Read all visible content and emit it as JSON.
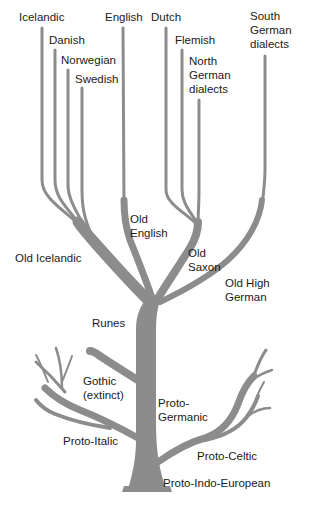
{
  "diagram": {
    "branch_color": "#8c8c8c",
    "text_color": "#1a1a1a",
    "background": "#ffffff",
    "root": "Proto-Indo-European",
    "nodes": {
      "icelandic": "Icelandic",
      "danish": "Danish",
      "norwegian": "Norwegian",
      "swedish": "Swedish",
      "english": "English",
      "dutch": "Dutch",
      "flemish": "Flemish",
      "north_german_1": "North",
      "north_german_2": "German",
      "north_german_3": "dialects",
      "south_german_1": "South",
      "south_german_2": "German",
      "south_german_3": "dialects",
      "old_english_1": "Old",
      "old_english_2": "English",
      "old_icelandic": "Old Icelandic",
      "old_saxon_1": "Old",
      "old_saxon_2": "Saxon",
      "old_high_german_1": "Old High",
      "old_high_german_2": "German",
      "runes": "Runes",
      "gothic_1": "Gothic",
      "gothic_2": "(extinct)",
      "proto_germanic_1": "Proto-",
      "proto_germanic_2": "Germanic",
      "proto_italic": "Proto-Italic",
      "proto_celtic": "Proto-Celtic",
      "proto_indo_european": "Proto-Indo-European"
    },
    "edges": [
      [
        "Proto-Indo-European",
        "Proto-Germanic"
      ],
      [
        "Proto-Indo-European",
        "Proto-Italic"
      ],
      [
        "Proto-Indo-European",
        "Proto-Celtic"
      ],
      [
        "Proto-Germanic",
        "Gothic (extinct)"
      ],
      [
        "Proto-Germanic",
        "Runes"
      ],
      [
        "Runes",
        "Old Icelandic"
      ],
      [
        "Runes",
        "Old English"
      ],
      [
        "Runes",
        "Old Saxon"
      ],
      [
        "Runes",
        "Old High German"
      ],
      [
        "Old Icelandic",
        "Icelandic"
      ],
      [
        "Old Icelandic",
        "Danish"
      ],
      [
        "Old Icelandic",
        "Norwegian"
      ],
      [
        "Old Icelandic",
        "Swedish"
      ],
      [
        "Old English",
        "English"
      ],
      [
        "Old Saxon",
        "Dutch"
      ],
      [
        "Old Saxon",
        "Flemish"
      ],
      [
        "Old Saxon",
        "North German dialects"
      ],
      [
        "Old High German",
        "South German dialects"
      ]
    ]
  }
}
